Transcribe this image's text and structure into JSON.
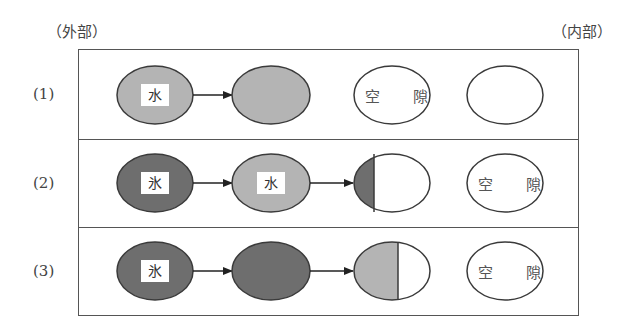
{
  "labels": {
    "outside": "（外部）",
    "inside": "（内部）"
  },
  "rows": [
    {
      "label": "(1)",
      "stages": [
        {
          "fill": "light",
          "tag": "水"
        },
        {
          "fill": "light",
          "tag": ""
        },
        {
          "fill": "void",
          "text": "空隙"
        },
        {
          "fill": "void",
          "text": ""
        }
      ]
    },
    {
      "label": "(2)",
      "stages": [
        {
          "fill": "dark",
          "tag": "氷"
        },
        {
          "fill": "light",
          "tag": "水"
        },
        {
          "fill": "half-dark-left",
          "tag": ""
        },
        {
          "fill": "void",
          "text": "空隙"
        }
      ]
    },
    {
      "label": "(3)",
      "stages": [
        {
          "fill": "dark",
          "tag": "氷"
        },
        {
          "fill": "dark",
          "tag": ""
        },
        {
          "fill": "half-light-left",
          "tag": ""
        },
        {
          "fill": "void",
          "text": "空隙"
        }
      ]
    }
  ],
  "colors": {
    "dark": "#6e6e6e",
    "light": "#b4b4b4",
    "void": "#ffffff",
    "stroke": "#3a3a3a"
  },
  "text": {
    "r1_tag1": "水",
    "r1_void": "空 隙",
    "r2_tag1": "氷",
    "r2_tag2": "水",
    "r2_void": "空 隙",
    "r3_tag1": "氷",
    "r3_void": "空 隙",
    "r1": "(1)",
    "r2": "(2)",
    "r3": "(3)"
  }
}
